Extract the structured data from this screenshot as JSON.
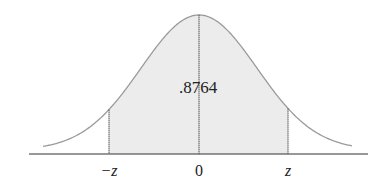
{
  "diagram": {
    "type": "normal-distribution-area",
    "shaded_area_label": ".8764",
    "axis_labels": {
      "left": "−z",
      "center": "0",
      "right": "z"
    },
    "colors": {
      "curve": "#9a9a9a",
      "fill": "#ececec",
      "axis": "#333333",
      "lines": "#555555"
    }
  }
}
